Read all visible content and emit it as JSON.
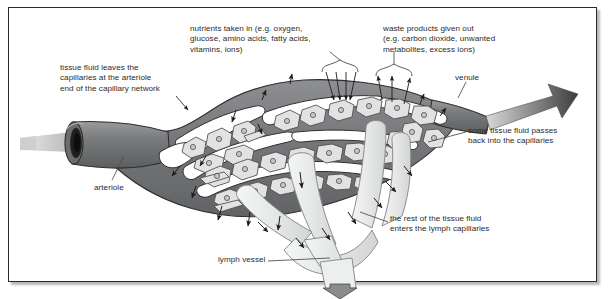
{
  "figure": {
    "border_color": "#2a2a2a",
    "background": "#ffffff"
  },
  "palette": {
    "vessel_dark": "#77787a",
    "vessel_outline": "#2e2e2e",
    "cell_fill": "#e2e2e2",
    "cell_outline": "#4a4a4a",
    "nucleus_fill": "#c9c9c9",
    "lymph_fill": "#eceded",
    "lymph_outline": "#8c8d8f",
    "arrow": "#1c1c1c",
    "text": "#2b2b2b",
    "flow_arrow": "#6e6f71"
  },
  "labels": {
    "tissue_fluid_leaves": "tissue fluid leaves the\ncapillaries at the arteriole\nend of the capillary network",
    "nutrients": "nutrients taken in (e.g. oxygen,\nglucose, amino acids, fatty acids,\nvitamins, ions)",
    "waste": "waste products given out\n(e.g. carbon dioxide, unwanted\nmetabolites, excess ions)",
    "venule": "venule",
    "some_tissue_fluid": "some tissue fluid passes\nback into the capillaries",
    "rest_of_fluid": "the rest of the tissue fluid\nenters the lymph capillaries",
    "lymph_vessel": "lymph vessel",
    "arteriole": "arteriole"
  },
  "structures": {
    "arteriole": {
      "name": "arteriole",
      "position": "left",
      "flow": "in"
    },
    "venule": {
      "name": "venule",
      "position": "right",
      "flow": "out"
    },
    "capillary_network": {
      "name": "capillary network",
      "position": "center"
    },
    "lymph_vessel": {
      "name": "lymph vessel",
      "position": "bottom-center",
      "flow": "out"
    },
    "tissue_cells": {
      "name": "tissue cells",
      "count": 38
    }
  }
}
